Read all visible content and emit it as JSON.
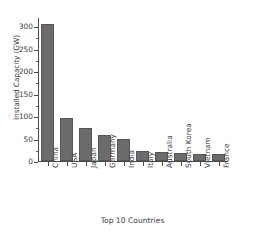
{
  "chart_data": {
    "type": "bar",
    "title": "",
    "xlabel": "Top 10 Countries",
    "ylabel": "Installed Capacity (GW)",
    "categories": [
      "China",
      "USA",
      "Japan",
      "Germany",
      "India",
      "Italy",
      "Australia",
      "South Korea",
      "Vietnam",
      "France"
    ],
    "values": [
      305,
      95,
      74,
      58,
      49,
      23,
      19,
      18,
      16,
      15
    ],
    "ylim": [
      0,
      320
    ],
    "yticks": [
      0,
      50,
      100,
      150,
      200,
      250,
      300
    ],
    "ytick_labels": [
      "0",
      "50",
      "100",
      "150",
      "200",
      "250",
      "300"
    ],
    "grid": false,
    "legend": false,
    "bar_color": "#6b6b6b",
    "edge_color": "#565656",
    "background": "#ffffff"
  }
}
